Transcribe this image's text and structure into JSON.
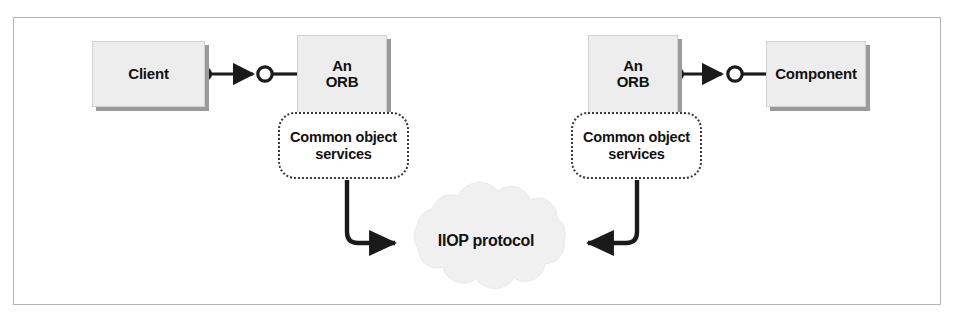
{
  "figure": {
    "background_color": "#ffffff",
    "frame_color": "#b4b4b4",
    "box_fill": "#ededed",
    "box_shadow_color": "#9a9a9a",
    "cloud_fill": "#f0f0f0",
    "line_color": "#1a1a1a"
  },
  "nodes": {
    "client": {
      "label": "Client"
    },
    "orb_left": {
      "label": "An\nORB"
    },
    "orb_right": {
      "label": "An\nORB"
    },
    "component": {
      "label": "Component"
    },
    "services_left": {
      "label": "Common object\nservices"
    },
    "services_right": {
      "label": "Common object\nservices"
    },
    "cloud": {
      "label": "IIOP protocol"
    }
  },
  "connectors": {
    "client_to_orb": {
      "name": "ball-and-socket-connector",
      "from": "client",
      "to": "orb_left",
      "style": "ball-arrow-socket"
    },
    "orb_to_component": {
      "name": "ball-and-socket-connector",
      "from": "orb_right",
      "to": "component",
      "style": "ball-arrow-socket"
    },
    "services_left_to_cloud": {
      "name": "elbow-arrow",
      "from": "services_left",
      "to": "cloud",
      "direction": "down-right"
    },
    "services_right_to_cloud": {
      "name": "elbow-arrow",
      "from": "services_right",
      "to": "cloud",
      "direction": "down-left"
    }
  }
}
